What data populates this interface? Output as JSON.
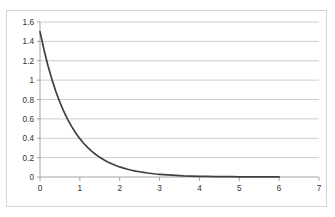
{
  "chart_data": {
    "type": "line",
    "title": "",
    "subtitle": "",
    "xlabel": "",
    "ylabel": "",
    "xlim": [
      0,
      7
    ],
    "ylim": [
      0,
      1.6
    ],
    "grid": true,
    "grid_axis": "y",
    "legend": false,
    "legend_position": "none",
    "x_ticks": [
      "0",
      "1",
      "2",
      "3",
      "4",
      "5",
      "6",
      "7"
    ],
    "x_tick_values": [
      0,
      1,
      2,
      3,
      4,
      5,
      6,
      7
    ],
    "y_ticks": [
      "0",
      "0.2",
      "0.4",
      "0.6",
      "0.8",
      "1",
      "1.2",
      "1.4",
      "1.6"
    ],
    "y_tick_values": [
      0,
      0.2,
      0.4,
      0.6,
      0.8,
      1,
      1.2,
      1.4,
      1.6
    ],
    "series": [
      {
        "name": "exponential-decay",
        "color": "#404040",
        "x": [
          0,
          0.1,
          0.2,
          0.3,
          0.4,
          0.5,
          0.6,
          0.7,
          0.8,
          0.9,
          1.0,
          1.1,
          1.2,
          1.3,
          1.4,
          1.5,
          1.6,
          1.7,
          1.8,
          1.9,
          2.0,
          2.1,
          2.2,
          2.3,
          2.4,
          2.5,
          2.6,
          2.7,
          2.8,
          2.9,
          3.0,
          3.2,
          3.4,
          3.6,
          3.8,
          4.0,
          4.2,
          4.4,
          4.6,
          4.8,
          5.0,
          5.2,
          5.4,
          5.6,
          5.8,
          6.0
        ],
        "values": [
          1.5,
          1.313,
          1.149,
          1.006,
          0.88,
          0.77,
          0.674,
          0.59,
          0.517,
          0.452,
          0.396,
          0.346,
          0.303,
          0.265,
          0.232,
          0.203,
          0.178,
          0.156,
          0.136,
          0.119,
          0.104,
          0.091,
          0.08,
          0.07,
          0.061,
          0.054,
          0.047,
          0.041,
          0.036,
          0.031,
          0.027,
          0.021,
          0.016,
          0.012,
          0.01,
          0.007,
          0.006,
          0.004,
          0.003,
          0.003,
          0.002,
          0.002,
          0.001,
          0.001,
          0.001,
          0.001
        ]
      }
    ]
  },
  "colors": {
    "series": "#404040",
    "gridline": "#bfbfbf",
    "axis": "#9a9a9a",
    "border": "#d4d4d4",
    "text": "#2f2f2f",
    "background": "#ffffff"
  }
}
